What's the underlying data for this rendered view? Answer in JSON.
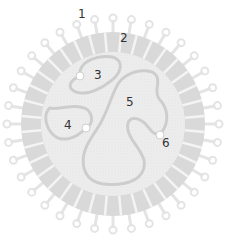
{
  "diagram": {
    "colors": {
      "background": "#ffffff",
      "envelope_band": "#d8d8d8",
      "spike": "#e6e6e6",
      "core": "#ececec",
      "strand": "#cfcfcf",
      "label": "#333333"
    },
    "labels": [
      {
        "id": "1",
        "text": "1",
        "x": 78,
        "y": 8
      },
      {
        "id": "2",
        "text": "2",
        "x": 120,
        "y": 32
      },
      {
        "id": "3",
        "text": "3",
        "x": 94,
        "y": 69
      },
      {
        "id": "4",
        "text": "4",
        "x": 64,
        "y": 119
      },
      {
        "id": "5",
        "text": "5",
        "x": 126,
        "y": 96
      },
      {
        "id": "6",
        "text": "6",
        "x": 162,
        "y": 137
      }
    ]
  }
}
